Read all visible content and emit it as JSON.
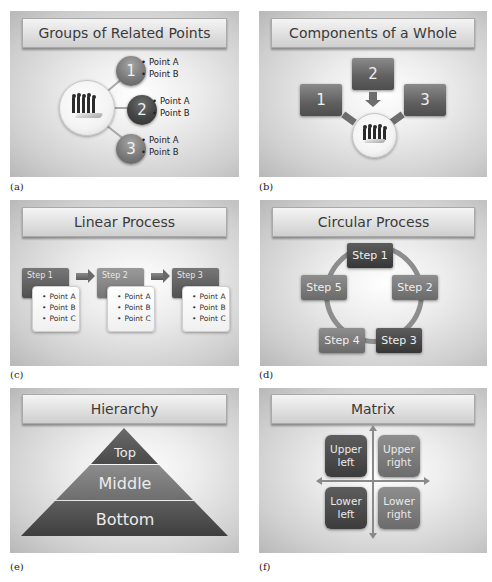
{
  "panels": {
    "a": {
      "label": "(a)",
      "title": "Groups of Related Points",
      "groups": [
        {
          "number": "1",
          "points": [
            "Point A",
            "Point B"
          ]
        },
        {
          "number": "2",
          "points": [
            "Point A",
            "Point B"
          ]
        },
        {
          "number": "3",
          "points": [
            "Point A",
            "Point B"
          ]
        }
      ],
      "hub_icon": "people-on-hand-icon"
    },
    "b": {
      "label": "(b)",
      "title": "Components of a Whole",
      "components": [
        "1",
        "2",
        "3"
      ],
      "hub_icon": "people-on-hand-icon"
    },
    "c": {
      "label": "(c)",
      "title": "Linear Process",
      "steps": [
        {
          "name": "Step 1",
          "points": [
            "Point A",
            "Point B",
            "Point C"
          ]
        },
        {
          "name": "Step 2",
          "points": [
            "Point A",
            "Point B",
            "Point C"
          ]
        },
        {
          "name": "Step 3",
          "points": [
            "Point A",
            "Point B",
            "Point C"
          ]
        }
      ]
    },
    "d": {
      "label": "(d)",
      "title": "Circular Process",
      "steps": [
        "Step 1",
        "Step 2",
        "Step 3",
        "Step 4",
        "Step 5"
      ]
    },
    "e": {
      "label": "(e)",
      "title": "Hierarchy",
      "levels": [
        "Top",
        "Middle",
        "Bottom"
      ]
    },
    "f": {
      "label": "(f)",
      "title": "Matrix",
      "quadrants": {
        "upper_left": [
          "Upper",
          "left"
        ],
        "upper_right": [
          "Upper",
          "right"
        ],
        "lower_left": [
          "Lower",
          "left"
        ],
        "lower_right": [
          "Lower",
          "right"
        ]
      }
    }
  },
  "colors": {
    "slide_center": "#ffffff",
    "slide_edge": "#b8b8b8",
    "dark_shape": "#3c3c3c",
    "light_shape": "#7a7a7a"
  }
}
